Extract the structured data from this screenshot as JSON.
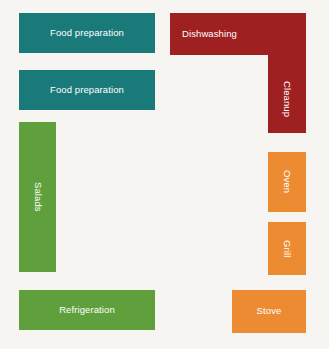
{
  "diagram": {
    "background_color": "#f7f5f1",
    "width": 329,
    "height": 349
  },
  "palette": {
    "food_prep": "#1a7a7a",
    "salads_refrigeration": "#5fa03c",
    "dishwashing_cleanup": "#9e2020",
    "cooking_equipment": "#ed8b33",
    "label_text": "#ffffff"
  },
  "zones": {
    "food_prep_1": {
      "label": "Food preparation",
      "color": "#1a7a7a",
      "orientation": "horizontal"
    },
    "food_prep_2": {
      "label": "Food preparation",
      "color": "#1a7a7a",
      "orientation": "horizontal"
    },
    "salads": {
      "label": "Salads",
      "color": "#5fa03c",
      "orientation": "vertical"
    },
    "refrigeration": {
      "label": "Refrigeration",
      "color": "#5fa03c",
      "orientation": "horizontal"
    },
    "dishwashing": {
      "label": "Dishwashing",
      "color": "#9e2020",
      "orientation": "horizontal"
    },
    "cleanup": {
      "label": "Cleanup",
      "color": "#9e2020",
      "orientation": "vertical"
    },
    "oven": {
      "label": "Oven",
      "color": "#ed8b33",
      "orientation": "vertical"
    },
    "grill": {
      "label": "Grill",
      "color": "#ed8b33",
      "orientation": "vertical"
    },
    "stove": {
      "label": "Stove",
      "color": "#ed8b33",
      "orientation": "horizontal"
    }
  }
}
